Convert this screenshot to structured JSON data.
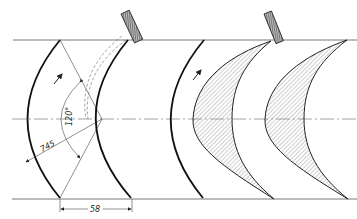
{
  "figure": {
    "type": "technical-drawing",
    "colors": {
      "line": "#1a1a1a",
      "thin_line": "#555555",
      "hatch": "#777777",
      "fill": "#ffffff"
    }
  },
  "dimensions": {
    "angle_label": "120°",
    "radius_label": "745",
    "pitch_label": "58"
  },
  "components": [
    {
      "name": "reference-arc-1",
      "kind": "circular-arc"
    },
    {
      "name": "reference-arc-2",
      "kind": "circular-arc",
      "note": "with dashed tool paths"
    },
    {
      "name": "reference-arc-3",
      "kind": "circular-arc"
    },
    {
      "name": "blade-profile-1",
      "kind": "hatched-section"
    },
    {
      "name": "blade-profile-2",
      "kind": "hatched-section"
    },
    {
      "name": "grinding-tool-1",
      "kind": "hatched-rectangle"
    },
    {
      "name": "grinding-tool-2",
      "kind": "hatched-rectangle"
    }
  ],
  "arrows": [
    {
      "name": "rotation-arrow-1",
      "direction": "up-right"
    },
    {
      "name": "rotation-arrow-2",
      "direction": "up-right"
    }
  ]
}
